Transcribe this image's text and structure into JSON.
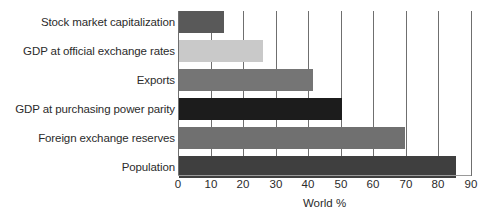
{
  "chart_data": {
    "type": "bar",
    "orientation": "horizontal",
    "title": "",
    "subtitle": "",
    "xlabel": "World %",
    "ylabel": "",
    "xlim": [
      0,
      90
    ],
    "xticks": [
      0,
      10,
      20,
      30,
      40,
      50,
      60,
      70,
      80,
      90
    ],
    "xtick_labels": [
      "0",
      "10",
      "20",
      "30",
      "40",
      "50",
      "60",
      "70",
      "80",
      "90"
    ],
    "grid": "vertical",
    "legend": "none",
    "categories": [
      "Stock market capitalization",
      "GDP at official exchange rates",
      "Exports",
      "GDP at purchasing power parity",
      "Foreign exchange reserves",
      "Population"
    ],
    "values": [
      13.8,
      25.8,
      41.2,
      50.0,
      69.5,
      85.0
    ],
    "bar_colors": [
      "#595959",
      "#c9c9c9",
      "#757575",
      "#1c1c1c",
      "#707070",
      "#3f3f3f"
    ],
    "axis_color": "#6f6f6f",
    "text_color": "#2b2b2b",
    "background": "#ffffff"
  },
  "bars": [
    {
      "label": "Stock market capitalization",
      "value": 13.8,
      "color": "#595959"
    },
    {
      "label": "GDP at official exchange rates",
      "value": 25.8,
      "color": "#c9c9c9"
    },
    {
      "label": "Exports",
      "value": 41.2,
      "color": "#757575"
    },
    {
      "label": "GDP at purchasing power parity",
      "value": 50.0,
      "color": "#1c1c1c"
    },
    {
      "label": "Foreign exchange reserves",
      "value": 69.5,
      "color": "#707070"
    },
    {
      "label": "Population",
      "value": 85.0,
      "color": "#3f3f3f"
    }
  ],
  "axis": {
    "title": "World %",
    "ticks": [
      "0",
      "10",
      "20",
      "30",
      "40",
      "50",
      "60",
      "70",
      "80",
      "90"
    ]
  }
}
